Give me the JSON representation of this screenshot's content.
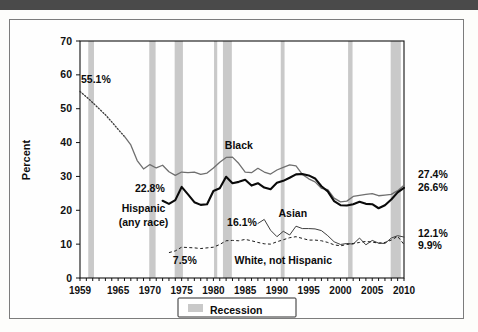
{
  "topbar": {
    "present": true,
    "color": "#4a4a4a"
  },
  "chart_data": {
    "type": "line",
    "title": "",
    "xlabel": "",
    "ylabel": "Percent",
    "xlim": [
      1959,
      2010
    ],
    "ylim": [
      0,
      70
    ],
    "grid": false,
    "legend_position": "bottom-center",
    "x_tick_labels": [
      "1959",
      "1965",
      "1970",
      "1975",
      "1980",
      "1985",
      "1990",
      "1995",
      "2000",
      "2005",
      "2010"
    ],
    "x_tick_values": [
      1959,
      1965,
      1970,
      1975,
      1980,
      1985,
      1990,
      1995,
      2000,
      2005,
      2010
    ],
    "y_tick_labels": [
      "0",
      "10",
      "20",
      "30",
      "40",
      "50",
      "60",
      "70"
    ],
    "y_tick_values": [
      0,
      10,
      20,
      30,
      40,
      50,
      60,
      70
    ],
    "legend": [
      {
        "label": "Recession",
        "color": "#c9c9c9",
        "style": "band"
      }
    ],
    "annotations": [
      {
        "text": "55.1%",
        "x": 1961.5,
        "y": 57.5,
        "series": "Black"
      },
      {
        "text": "22.8%",
        "x": 1970.0,
        "y": 25.4,
        "series": "Hispanic (any race)"
      },
      {
        "text": "16.1%",
        "x": 1984.5,
        "y": 15.5,
        "series": "Asian"
      },
      {
        "text": "7.5%",
        "x": 1975.5,
        "y": 4.0,
        "series": "White, not Hispanic"
      },
      {
        "text": "27.4%",
        "x": 2011.5,
        "y": 29.5,
        "series": "Black"
      },
      {
        "text": "26.6%",
        "x": 2011.5,
        "y": 25.6,
        "series": "Hispanic (any race)"
      },
      {
        "text": "12.1%",
        "x": 2011.5,
        "y": 12.2,
        "series": "Asian"
      },
      {
        "text": "9.9%",
        "x": 2011.5,
        "y": 8.6,
        "series": "White, not Hispanic"
      },
      {
        "text": "Black",
        "x": 1984.0,
        "y": 38.0,
        "series": "Black"
      },
      {
        "text": "Hispanic",
        "x": 1969.0,
        "y": 19.5,
        "series": "Hispanic (any race)"
      },
      {
        "text": "(any race)",
        "x": 1969.0,
        "y": 15.5,
        "series": "Hispanic (any race)"
      },
      {
        "text": "Asian",
        "x": 1992.5,
        "y": 18.0,
        "series": "Asian"
      },
      {
        "text": "White, not Hispanic",
        "x": 1991.0,
        "y": 4.0,
        "series": "White, not Hispanic"
      }
    ],
    "recessions": [
      {
        "start": 1960.3,
        "end": 1961.2
      },
      {
        "start": 1969.9,
        "end": 1970.9
      },
      {
        "start": 1973.9,
        "end": 1975.2
      },
      {
        "start": 1980.1,
        "end": 1980.6
      },
      {
        "start": 1981.5,
        "end": 1982.9
      },
      {
        "start": 1990.6,
        "end": 1991.2
      },
      {
        "start": 2001.2,
        "end": 2001.9
      },
      {
        "start": 2007.9,
        "end": 2009.5
      }
    ],
    "series": [
      {
        "name": "Black",
        "style": "solid-gray",
        "color": "#6f6f6f",
        "dotted_segment_years": [
          1959,
          1966
        ],
        "x": [
          1959,
          1960,
          1961,
          1962,
          1963,
          1964,
          1965,
          1966,
          1967,
          1968,
          1969,
          1970,
          1971,
          1972,
          1973,
          1974,
          1975,
          1976,
          1977,
          1978,
          1979,
          1980,
          1981,
          1982,
          1983,
          1984,
          1985,
          1986,
          1987,
          1988,
          1989,
          1990,
          1991,
          1992,
          1993,
          1994,
          1995,
          1996,
          1997,
          1998,
          1999,
          2000,
          2001,
          2002,
          2003,
          2004,
          2005,
          2006,
          2007,
          2008,
          2009,
          2010
        ],
        "values": [
          55.1,
          53.5,
          51.8,
          50.0,
          48.2,
          46.1,
          43.9,
          41.8,
          39.3,
          34.7,
          32.2,
          33.5,
          32.5,
          33.3,
          31.4,
          30.3,
          31.3,
          31.1,
          31.3,
          30.6,
          31.0,
          32.5,
          34.2,
          35.6,
          35.7,
          33.8,
          31.3,
          31.1,
          32.4,
          31.3,
          30.7,
          31.9,
          32.7,
          33.4,
          33.1,
          30.6,
          29.3,
          28.4,
          26.5,
          26.1,
          23.6,
          22.5,
          22.7,
          24.1,
          24.4,
          24.7,
          24.9,
          24.3,
          24.5,
          24.7,
          25.8,
          27.4
        ]
      },
      {
        "name": "Hispanic (any race)",
        "style": "solid-black-thick",
        "color": "#0a0a0a",
        "x": [
          1972,
          1973,
          1974,
          1975,
          1976,
          1977,
          1978,
          1979,
          1980,
          1981,
          1982,
          1983,
          1984,
          1985,
          1986,
          1987,
          1988,
          1989,
          1990,
          1991,
          1992,
          1993,
          1994,
          1995,
          1996,
          1997,
          1998,
          1999,
          2000,
          2001,
          2002,
          2003,
          2004,
          2005,
          2006,
          2007,
          2008,
          2009,
          2010
        ],
        "values": [
          22.8,
          21.9,
          23.0,
          26.9,
          24.7,
          22.4,
          21.6,
          21.8,
          25.7,
          26.5,
          29.9,
          28.0,
          28.4,
          29.0,
          27.3,
          28.0,
          26.7,
          26.2,
          28.1,
          28.7,
          29.6,
          30.6,
          30.7,
          30.3,
          29.4,
          27.1,
          25.6,
          22.7,
          21.5,
          21.4,
          21.8,
          22.5,
          21.9,
          21.8,
          20.6,
          21.5,
          23.2,
          25.3,
          26.6
        ]
      },
      {
        "name": "Asian",
        "style": "solid-thin",
        "color": "#3e3e3e",
        "x": [
          1987,
          1988,
          1989,
          1990,
          1991,
          1992,
          1993,
          1994,
          1995,
          1996,
          1997,
          1998,
          1999,
          2000,
          2001,
          2002,
          2003,
          2004,
          2005,
          2006,
          2007,
          2008,
          2009,
          2010
        ],
        "values": [
          16.1,
          17.3,
          14.1,
          12.2,
          13.8,
          12.7,
          15.3,
          14.6,
          14.6,
          14.5,
          14.0,
          12.5,
          10.7,
          9.9,
          10.2,
          10.0,
          11.8,
          9.8,
          11.1,
          10.3,
          10.2,
          11.8,
          12.5,
          12.1
        ]
      },
      {
        "name": "White, not Hispanic",
        "style": "dashed",
        "color": "#1a1a1a",
        "x": [
          1973,
          1974,
          1975,
          1976,
          1977,
          1978,
          1979,
          1980,
          1981,
          1982,
          1983,
          1984,
          1985,
          1986,
          1987,
          1988,
          1989,
          1990,
          1991,
          1992,
          1993,
          1994,
          1995,
          1996,
          1997,
          1998,
          1999,
          2000,
          2001,
          2002,
          2003,
          2004,
          2005,
          2006,
          2007,
          2008,
          2009,
          2010
        ],
        "values": [
          7.5,
          8.0,
          9.1,
          9.0,
          8.9,
          8.7,
          8.9,
          9.1,
          9.9,
          11.0,
          11.1,
          11.0,
          11.4,
          11.0,
          10.5,
          10.1,
          10.0,
          10.7,
          11.3,
          11.9,
          12.2,
          11.7,
          11.2,
          11.2,
          11.0,
          10.5,
          9.8,
          9.5,
          9.9,
          10.2,
          10.5,
          10.8,
          10.6,
          10.3,
          10.5,
          11.2,
          12.3,
          9.9
        ]
      }
    ]
  }
}
